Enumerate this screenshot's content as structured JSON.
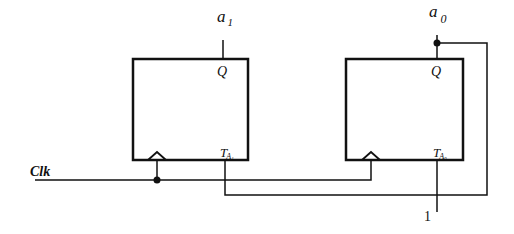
{
  "diagram": {
    "type": "circuit",
    "title": "",
    "flip_flops": [
      {
        "id": "ff1",
        "output_label": "Q",
        "input_label": "T",
        "input_subscript": "A₁",
        "output_signal": "a",
        "output_signal_sub": "1"
      },
      {
        "id": "ff0",
        "output_label": "Q",
        "input_label": "T",
        "input_subscript": "A₀",
        "output_signal": "a",
        "output_signal_sub": "0"
      }
    ],
    "clock_label": "Clk",
    "constant_input": "1",
    "colors": {
      "line": "#111111",
      "background": "#ffffff"
    }
  }
}
